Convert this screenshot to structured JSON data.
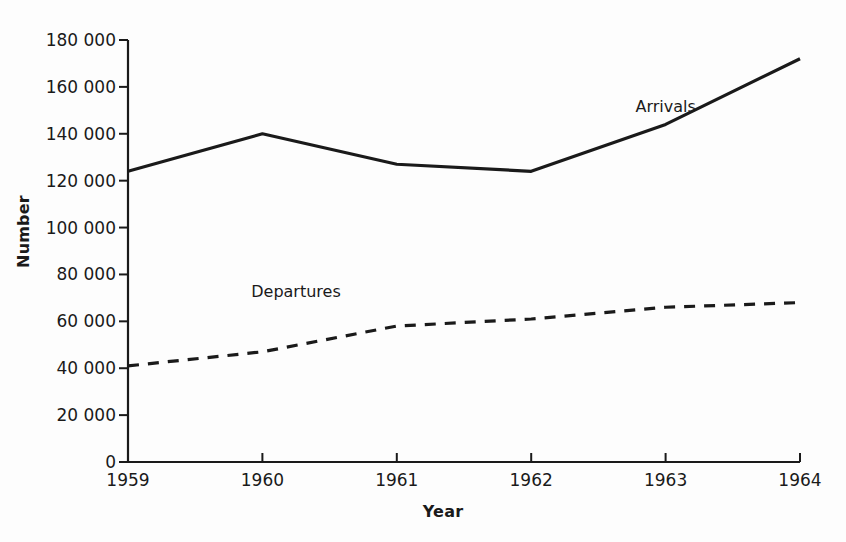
{
  "chart_data": {
    "type": "line",
    "title": "",
    "xlabel": "Year",
    "ylabel": "Number",
    "categories": [
      "1959",
      "1960",
      "1961",
      "1962",
      "1963",
      "1964"
    ],
    "x": [
      1959,
      1960,
      1961,
      1962,
      1963,
      1964
    ],
    "xlim": [
      1959,
      1964
    ],
    "ylim": [
      0,
      180000
    ],
    "ytick_values": [
      0,
      20000,
      40000,
      60000,
      80000,
      100000,
      120000,
      140000,
      160000,
      180000
    ],
    "ytick_labels": [
      "0",
      "20 000",
      "40 000",
      "60 000",
      "80 000",
      "100 000",
      "120 000",
      "140 000",
      "160 000",
      "180 000"
    ],
    "xtick_labels": [
      "1959",
      "1960",
      "1961",
      "1962",
      "1963",
      "1964"
    ],
    "grid": false,
    "legend_position": "inline-annotation",
    "series": [
      {
        "name": "Arrivals",
        "style": "solid",
        "color": "#1a1a1a",
        "width": 3.2,
        "values": [
          124000,
          140000,
          127000,
          124000,
          144000,
          172000
        ]
      },
      {
        "name": "Departures",
        "style": "dashed",
        "color": "#1a1a1a",
        "width": 3.2,
        "values": [
          41000,
          47000,
          58000,
          61000,
          66000,
          68000
        ]
      }
    ],
    "annotations": [
      {
        "text": "Arrivals",
        "x": 1963.0,
        "y": 152000
      },
      {
        "text": "Departures",
        "x": 1960.25,
        "y": 73000
      }
    ]
  },
  "colors": {
    "background": "#fdfdfd",
    "axis": "#1a1a1a",
    "text": "#1a1a1a"
  }
}
